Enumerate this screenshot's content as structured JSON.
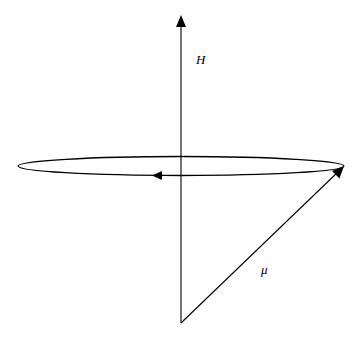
{
  "diagram": {
    "type": "precession-diagram",
    "labels": {
      "field": "H",
      "moment": "μ"
    },
    "elements": {
      "field_axis": {
        "from": [
          181,
          323
        ],
        "to": [
          181,
          17
        ],
        "arrow": "end"
      },
      "moment_vector": {
        "from": [
          181,
          323
        ],
        "to": [
          344,
          166
        ],
        "arrow": "end"
      },
      "precession_orbit": {
        "cx": 181,
        "cy": 166,
        "rx": 163,
        "ry": 9.5,
        "direction_arrow_at": [
          155,
          175
        ]
      }
    },
    "stroke_color": "#000000"
  }
}
